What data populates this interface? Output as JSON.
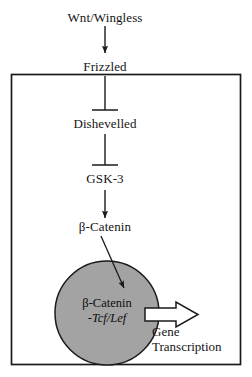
{
  "diagram": {
    "colors": {
      "nucleus_fill": "#a3a3a3",
      "nucleus_stroke": "#1a1a1a",
      "line": "#1a1a1a",
      "cell_border": "#1a1a1a",
      "block_arrow_fill": "#ffffff",
      "background": "#ffffff"
    },
    "nodes": {
      "ligand": "Wnt/Wingless",
      "receptor": "Frizzled",
      "dishevelled": "Dishevelled",
      "gsk3": "GSK-3",
      "beta_catenin": "β-Catenin"
    },
    "nucleus": {
      "complex_line_1": "β-Catenin",
      "complex_line_2": "-Tcf/Lef"
    },
    "output": {
      "line_1": "Gene",
      "line_2": "Transcription"
    },
    "connectors": [
      {
        "name": "wnt-to-frizzled",
        "type": "arrow",
        "from": "Wnt/Wingless",
        "to": "Frizzled"
      },
      {
        "name": "frizzled-to-dishevelled",
        "type": "inhibition",
        "from": "Frizzled",
        "to": "Dishevelled"
      },
      {
        "name": "dishevelled-to-gsk3",
        "type": "inhibition",
        "from": "Dishevelled",
        "to": "GSK-3"
      },
      {
        "name": "gsk3-to-beta-catenin",
        "type": "arrow",
        "from": "GSK-3",
        "to": "β-Catenin"
      },
      {
        "name": "beta-catenin-to-nucleus",
        "type": "arrow",
        "from": "β-Catenin",
        "to": "nucleus"
      },
      {
        "name": "nucleus-to-transcription",
        "type": "block-arrow",
        "from": "nucleus",
        "to": "Gene Transcription"
      }
    ]
  }
}
